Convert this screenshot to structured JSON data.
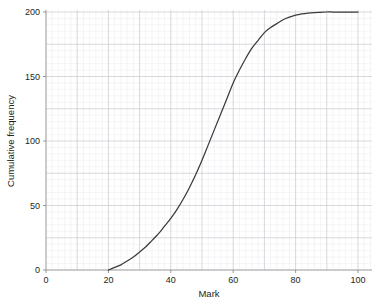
{
  "chart_data": {
    "type": "line",
    "title": "",
    "subtitle": "",
    "xlabel": "Mark",
    "ylabel": "Cumulative frequency",
    "xlim": [
      0,
      107
    ],
    "ylim": [
      0,
      207
    ],
    "xticks": [
      0,
      20,
      40,
      60,
      80,
      100
    ],
    "yticks": [
      0,
      50,
      100,
      150,
      200
    ],
    "xtick_labels": [
      "0",
      "20",
      "40",
      "60",
      "80",
      "100"
    ],
    "ytick_labels": [
      "0",
      "50",
      "100",
      "150",
      "200"
    ],
    "grid": true,
    "grid_major_x_step": 10,
    "grid_minor_x_step": 2,
    "grid_major_y_step": 25,
    "grid_minor_y_step": 5,
    "legend": null,
    "legend_position": "none",
    "series": [
      {
        "name": "Cumulative frequency",
        "color": "#3b3b3d",
        "x": [
          20,
          22,
          24,
          26,
          28,
          30,
          32,
          34,
          36,
          38,
          40,
          42,
          44,
          46,
          48,
          50,
          52,
          54,
          56,
          58,
          60,
          62,
          64,
          66,
          68,
          70,
          72,
          74,
          76,
          78,
          80,
          82,
          84,
          86,
          88,
          90,
          92,
          94,
          96,
          98,
          100
        ],
        "y": [
          0,
          2,
          4,
          7,
          10,
          14,
          18,
          23,
          28,
          34,
          40,
          47,
          55,
          64,
          74,
          85,
          97,
          109,
          121,
          133,
          145,
          155,
          164,
          172,
          178,
          184,
          188,
          191,
          194,
          196,
          197.5,
          198.5,
          199.2,
          199.6,
          199.8,
          200,
          200,
          200,
          200,
          200,
          200
        ]
      }
    ],
    "annotations": []
  },
  "axes": {
    "x_title": "Mark",
    "y_title": "Cumulative frequency"
  }
}
